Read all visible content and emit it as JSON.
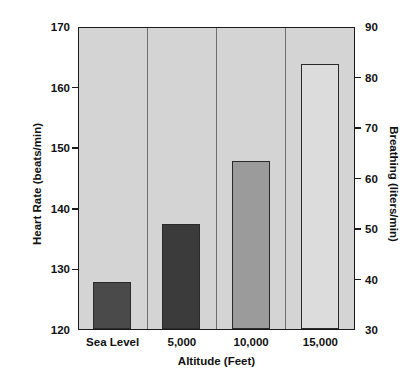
{
  "chart_data": {
    "type": "bar",
    "title": "",
    "categories": [
      "Sea Level",
      "5,000",
      "10,000",
      "15,000"
    ],
    "series": [
      {
        "name": "Heart Rate (beats/min)",
        "axis": "left",
        "values": [
          128,
          137.5,
          148,
          164
        ]
      },
      {
        "name": "Breathing (liters/min)",
        "axis": "right",
        "values": [
          39,
          51.5,
          64,
          83
        ]
      }
    ],
    "xlabel": "Altitude (Feet)",
    "ylabel": "Heart Rate (beats/min)",
    "ylabel_right": "Breathing (liters/min)",
    "ylim": [
      120,
      170
    ],
    "ylim_right": [
      30,
      90
    ],
    "yticks": [
      120,
      130,
      140,
      150,
      160,
      170
    ],
    "yticks_right": [
      30,
      40,
      50,
      60,
      70,
      80,
      90
    ],
    "grid": false,
    "legend": "none",
    "bar_colors": [
      "#4a4a4a",
      "#3b3b3b",
      "#9b9b9b",
      "#dcdcdc"
    ],
    "plot_background": "#d4d4d4",
    "axis_color": "#1a1a1a"
  },
  "axes": {
    "left": {
      "title": "Heart Rate (beats/min)",
      "ticks": [
        {
          "value": 170,
          "label": "170"
        },
        {
          "value": 160,
          "label": "160"
        },
        {
          "value": 150,
          "label": "150"
        },
        {
          "value": 140,
          "label": "140"
        },
        {
          "value": 130,
          "label": "130"
        },
        {
          "value": 120,
          "label": "120"
        }
      ]
    },
    "right": {
      "title": "Breathing (liters/min)",
      "ticks": [
        {
          "value": 90,
          "label": "90"
        },
        {
          "value": 80,
          "label": "80"
        },
        {
          "value": 70,
          "label": "70"
        },
        {
          "value": 60,
          "label": "60"
        },
        {
          "value": 50,
          "label": "50"
        },
        {
          "value": 40,
          "label": "40"
        },
        {
          "value": 30,
          "label": "30"
        }
      ]
    },
    "x": {
      "title": "Altitude (Feet)",
      "ticks": [
        {
          "label": "Sea Level"
        },
        {
          "label": "5,000"
        },
        {
          "label": "10,000"
        },
        {
          "label": "15,000"
        }
      ]
    }
  }
}
